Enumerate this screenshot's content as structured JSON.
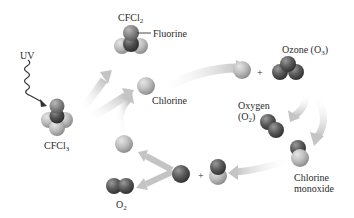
{
  "diagram": {
    "colors": {
      "chlorine": "#b4b4b4",
      "carbon": "#555555",
      "oxygen": "#4a4a4a",
      "fluorine": "#7a7a7a",
      "arrow": "#c8c8c8",
      "uv_wave": "#333333",
      "text": "#2a2a2a"
    },
    "labels": {
      "uv": "UV",
      "cfcl3_main": "CFCl",
      "cfcl3_sub": "3",
      "cfcl2_main": "CFCl",
      "cfcl2_sub": "2",
      "fluorine": "Fluorine",
      "chlorine": "Chlorine",
      "ozone_main": "Ozone (O",
      "ozone_sub": "3",
      "ozone_end": ")",
      "oxygen_line1": "Oxygen",
      "oxygen_line2_main": "(O",
      "oxygen_line2_sub": "2",
      "oxygen_line2_end": ")",
      "chlorine_monoxide_line1": "Chlorine",
      "chlorine_monoxide_line2": "monoxide",
      "o2_main": "O",
      "o2_sub": "2",
      "plus": "+"
    },
    "nodes": [
      {
        "id": "cfcl3",
        "label": "CFCl3"
      },
      {
        "id": "cfcl2",
        "label": "CFCl2"
      },
      {
        "id": "chlorine_atom",
        "label": "Chlorine"
      },
      {
        "id": "ozone",
        "label": "Ozone (O3)"
      },
      {
        "id": "oxygen",
        "label": "Oxygen (O2)"
      },
      {
        "id": "chlorine_monoxide",
        "label": "Chlorine monoxide"
      },
      {
        "id": "oxygen_atom_plus_clo",
        "label": "O + ClO"
      },
      {
        "id": "o2_product",
        "label": "O2"
      },
      {
        "id": "chlorine_regenerated",
        "label": "Chlorine"
      }
    ],
    "edges": [
      {
        "from": "UV",
        "to": "cfcl3",
        "label": "UV"
      },
      {
        "from": "cfcl3",
        "to": "cfcl2"
      },
      {
        "from": "cfcl3",
        "to": "chlorine_atom"
      },
      {
        "from": "chlorine_atom",
        "to": "ozone",
        "label": "+"
      },
      {
        "from": "ozone",
        "to": "oxygen"
      },
      {
        "from": "ozone",
        "to": "chlorine_monoxide"
      },
      {
        "from": "chlorine_monoxide",
        "to": "oxygen_atom_plus_clo"
      },
      {
        "from": "oxygen_atom_plus_clo",
        "to": "chlorine_regenerated"
      },
      {
        "from": "oxygen_atom_plus_clo",
        "to": "o2_product"
      },
      {
        "from": "chlorine_regenerated",
        "to": "chlorine_atom"
      }
    ]
  }
}
